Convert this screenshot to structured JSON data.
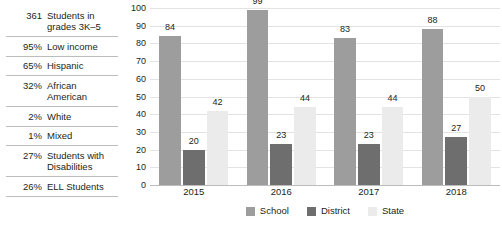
{
  "stats": {
    "rows": [
      {
        "value": "361",
        "label": "Students in grades 3K–5"
      },
      {
        "value": "95%",
        "label": "Low income"
      },
      {
        "value": "65%",
        "label": "Hispanic"
      },
      {
        "value": "32%",
        "label": "African American"
      },
      {
        "value": "2%",
        "label": "White"
      },
      {
        "value": "1%",
        "label": "Mixed"
      },
      {
        "value": "27%",
        "label": "Students with Disabilities"
      },
      {
        "value": "26%",
        "label": "ELL Students"
      }
    ]
  },
  "chart_data": {
    "type": "bar",
    "title": "",
    "subtitle": "",
    "xlabel": "",
    "ylabel": "",
    "categories": [
      "2015",
      "2016",
      "2017",
      "2018"
    ],
    "series": [
      {
        "name": "School",
        "values": [
          84,
          99,
          83,
          88
        ],
        "color": "#9d9d9d"
      },
      {
        "name": "District",
        "values": [
          20,
          23,
          23,
          27
        ],
        "color": "#6e6e6e"
      },
      {
        "name": "State",
        "values": [
          42,
          44,
          44,
          50
        ],
        "color": "#ebebeb"
      }
    ],
    "ylim": [
      0,
      100
    ],
    "yticks": [
      0,
      10,
      20,
      30,
      40,
      50,
      60,
      70,
      80,
      90,
      100
    ],
    "grid": true,
    "data_labels": true,
    "legend_position": "bottom"
  },
  "colors": {
    "school": "#9d9d9d",
    "district": "#6e6e6e",
    "state": "#ebebeb",
    "gridline": "#e3e3e3",
    "axis": "#bcbcbc",
    "text": "#231f20"
  }
}
